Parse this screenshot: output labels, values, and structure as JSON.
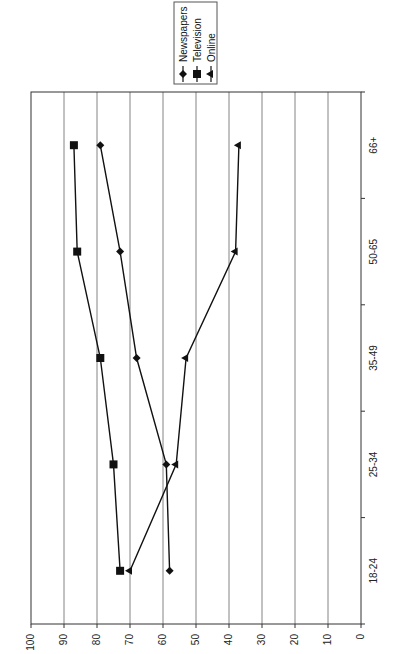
{
  "chart_data": {
    "type": "line",
    "title": "",
    "orientation": "rotated 90 degrees clockwise (value axis runs along bottom, categories along right side)",
    "xlabel": "",
    "ylabel": "",
    "categories": [
      "18-24",
      "25-34",
      "35-49",
      "50-65",
      "66+"
    ],
    "series": [
      {
        "name": "Newspapers",
        "marker": "diamond",
        "values": [
          58,
          59,
          68,
          73,
          79
        ]
      },
      {
        "name": "Television",
        "marker": "square",
        "values": [
          73,
          75,
          79,
          86,
          87
        ]
      },
      {
        "name": "Online",
        "marker": "triangle",
        "values": [
          70,
          56,
          53,
          38,
          37
        ]
      }
    ],
    "value_axis": {
      "min": 0,
      "max": 100,
      "step": 10,
      "ticks": [
        "0",
        "10",
        "20",
        "30",
        "40",
        "50",
        "60",
        "70",
        "80",
        "90",
        "100"
      ]
    },
    "grid": true,
    "legend_position": "top-right (rotated)"
  },
  "legend": {
    "items": [
      {
        "label": "Newspapers"
      },
      {
        "label": "Television"
      },
      {
        "label": "Online"
      }
    ]
  },
  "colors": {
    "line": "#111111",
    "grid": "#555555",
    "background": "#ffffff"
  }
}
